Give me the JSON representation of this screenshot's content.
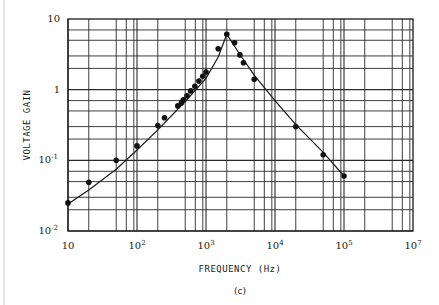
{
  "chart_data": {
    "type": "scatter",
    "subtype": "log-log scatter with fitted curve",
    "title": "",
    "caption": "(c)",
    "xlabel": "FREQUENCY (Hz)",
    "ylabel": "VOLTAGE GAIN",
    "xscale": "log",
    "yscale": "log",
    "xlim": [
      10,
      1000000
    ],
    "ylim": [
      0.01,
      10
    ],
    "x_ticks": [
      {
        "value": 10,
        "base": "10",
        "exp": ""
      },
      {
        "value": 100,
        "base": "10",
        "exp": "2"
      },
      {
        "value": 1000,
        "base": "10",
        "exp": "3"
      },
      {
        "value": 10000,
        "base": "10",
        "exp": "4"
      },
      {
        "value": 100000,
        "base": "10",
        "exp": "5"
      },
      {
        "value": 1000000,
        "base": "10",
        "exp": "7"
      }
    ],
    "y_ticks": [
      {
        "value": 10,
        "base": "10",
        "exp": ""
      },
      {
        "value": 1,
        "base": "1",
        "exp": ""
      },
      {
        "value": 0.1,
        "base": "10",
        "exp": "-1"
      },
      {
        "value": 0.01,
        "base": "10",
        "exp": "-2"
      }
    ],
    "grid": true,
    "x_minor_grid_multipliers": [
      2,
      5,
      7,
      9
    ],
    "y_minor_grid_multipliers": [
      2,
      3,
      5,
      7
    ],
    "legend": null,
    "series": [
      {
        "name": "measured",
        "style": "markers",
        "x": [
          10,
          20,
          50,
          100,
          200,
          250,
          390,
          440,
          470,
          530,
          600,
          690,
          790,
          900,
          1000,
          1500,
          2000,
          2600,
          3100,
          3500,
          5000,
          20000,
          50000,
          100000
        ],
        "y": [
          0.025,
          0.049,
          0.1,
          0.16,
          0.31,
          0.4,
          0.59,
          0.65,
          0.72,
          0.82,
          0.96,
          1.12,
          1.32,
          1.55,
          1.78,
          3.8,
          6.1,
          4.6,
          3.1,
          2.4,
          1.4,
          0.3,
          0.12,
          0.06
        ]
      },
      {
        "name": "fitted curve",
        "style": "line",
        "x": [
          10,
          20,
          50,
          100,
          200,
          500,
          1000,
          1500,
          2000,
          3000,
          5000,
          10000,
          20000,
          50000,
          100000
        ],
        "y": [
          0.024,
          0.038,
          0.075,
          0.14,
          0.27,
          0.68,
          1.45,
          2.9,
          6.1,
          3.3,
          1.6,
          0.7,
          0.32,
          0.13,
          0.06
        ]
      }
    ]
  }
}
